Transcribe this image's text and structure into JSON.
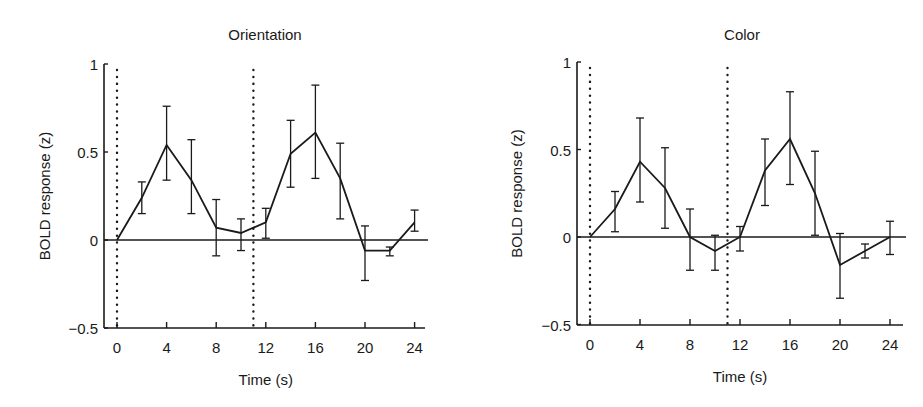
{
  "chart_data": [
    {
      "type": "line",
      "title": "Orientation",
      "xlabel": "Time (s)",
      "ylabel": "BOLD response (z)",
      "xlim": [
        -1,
        25
      ],
      "ylim": [
        -0.5,
        1
      ],
      "xticks": [
        0,
        4,
        8,
        12,
        16,
        20,
        24
      ],
      "xtick_labels": [
        "0",
        "4",
        "8",
        "12",
        "16",
        "20",
        "24"
      ],
      "yticks": [
        -0.5,
        0,
        0.5,
        1
      ],
      "ytick_labels": [
        "−0.5",
        "0",
        "0.5",
        "1"
      ],
      "grid": false,
      "legend": null,
      "reference_lines": {
        "horizontal_zero": true,
        "dotted_vertical_x": [
          0,
          11
        ]
      },
      "x": [
        0,
        2,
        4,
        6,
        8,
        10,
        12,
        14,
        16,
        18,
        20,
        22,
        24
      ],
      "series": [
        {
          "name": "Orientation",
          "values": [
            0.0,
            0.24,
            0.54,
            0.34,
            0.07,
            0.04,
            0.1,
            0.49,
            0.61,
            0.35,
            -0.06,
            -0.06,
            0.1
          ],
          "err_upper": [
            0.0,
            0.33,
            0.76,
            0.57,
            0.23,
            0.12,
            0.18,
            0.68,
            0.88,
            0.55,
            0.08,
            -0.04,
            0.17
          ],
          "err_lower": [
            0.0,
            0.15,
            0.34,
            0.15,
            -0.09,
            -0.06,
            0.01,
            0.3,
            0.35,
            0.12,
            -0.23,
            -0.09,
            0.05
          ]
        }
      ]
    },
    {
      "type": "line",
      "title": "Color",
      "xlabel": "Time (s)",
      "ylabel": "BOLD response (z)",
      "xlim": [
        -1,
        25
      ],
      "ylim": [
        -0.5,
        1
      ],
      "xticks": [
        0,
        4,
        8,
        12,
        16,
        20,
        24
      ],
      "xtick_labels": [
        "0",
        "4",
        "8",
        "12",
        "16",
        "20",
        "24"
      ],
      "yticks": [
        -0.5,
        0,
        0.5,
        1
      ],
      "ytick_labels": [
        "−0.5",
        "0",
        "0.5",
        "1"
      ],
      "grid": false,
      "legend": null,
      "reference_lines": {
        "horizontal_zero": true,
        "dotted_vertical_x": [
          0,
          11
        ]
      },
      "x": [
        0,
        2,
        4,
        6,
        8,
        10,
        12,
        14,
        16,
        18,
        20,
        22,
        24
      ],
      "series": [
        {
          "name": "Color",
          "values": [
            0.0,
            0.16,
            0.43,
            0.28,
            0.0,
            -0.08,
            0.0,
            0.38,
            0.56,
            0.25,
            -0.16,
            -0.08,
            0.0
          ],
          "err_upper": [
            0.0,
            0.26,
            0.68,
            0.51,
            0.16,
            0.01,
            0.06,
            0.56,
            0.83,
            0.49,
            0.02,
            -0.04,
            0.09
          ],
          "err_lower": [
            0.0,
            0.03,
            0.2,
            0.05,
            -0.19,
            -0.19,
            -0.08,
            0.18,
            0.3,
            0.01,
            -0.35,
            -0.12,
            -0.1
          ]
        }
      ]
    }
  ],
  "panels": {
    "left": {
      "title": "Orientation",
      "xlabel": "Time (s)",
      "ylabel": "BOLD response (z)"
    },
    "right": {
      "title": "Color",
      "xlabel": "Time (s)",
      "ylabel": "BOLD response (z)"
    }
  },
  "colors": {
    "line": "#1a1a1a",
    "background": "#ffffff"
  }
}
